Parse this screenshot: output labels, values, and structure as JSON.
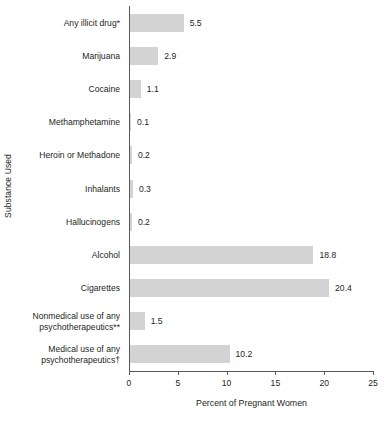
{
  "chart_data": {
    "type": "bar",
    "orientation": "horizontal",
    "title": "",
    "xlabel": "Percent of Pregnant Women",
    "ylabel": "Substance Used",
    "xlim": [
      0,
      25
    ],
    "xticks": [
      "0",
      "5",
      "10",
      "15",
      "20",
      "25"
    ],
    "grid": false,
    "legend": null,
    "bar_color": "#d3d3d3",
    "categories": [
      "Any illicit drug*",
      "Marijuana",
      "Cocaine",
      "Methamphetamine",
      "Heroin or Methadone",
      "Inhalants",
      "Hallucinogens",
      "Alcohol",
      "Cigarettes",
      "Nonmedical use of any\npsychotherapeutics**",
      "Medical use of any\npsychotherapeutics†"
    ],
    "values": [
      5.5,
      2.9,
      1.1,
      0.1,
      0.2,
      0.3,
      0.2,
      18.8,
      20.4,
      1.5,
      10.2
    ],
    "value_labels": [
      "5.5",
      "2.9",
      "1.1",
      "0.1",
      "0.2",
      "0.3",
      "0.2",
      "18.8",
      "20.4",
      "1.5",
      "10.2"
    ]
  }
}
